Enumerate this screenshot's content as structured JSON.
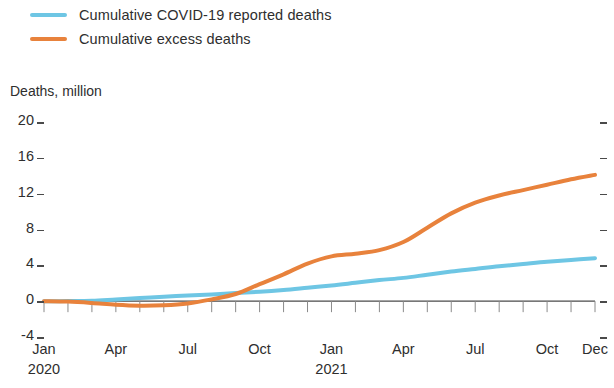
{
  "legend": {
    "items": [
      {
        "label": "Cumulative COVID-19 reported deaths",
        "color": "#6ec6e4",
        "key": "reported"
      },
      {
        "label": "Cumulative excess deaths",
        "color": "#e8823c",
        "key": "excess"
      }
    ]
  },
  "axis_title": "Deaths, million",
  "chart_data": {
    "type": "line",
    "title": "",
    "subtitle": "",
    "xlabel": "",
    "ylabel": "Deaths, million",
    "ylim": [
      -4,
      20
    ],
    "yticks": [
      20,
      16,
      12,
      8,
      4,
      0,
      -4
    ],
    "ytick_labels": [
      "20",
      "16",
      "12",
      "8",
      "4",
      "0",
      "-4"
    ],
    "grid": false,
    "legend_position": "top-left",
    "x_major_labels": [
      "Jan",
      "Apr",
      "Jul",
      "Oct",
      "Jan",
      "Apr",
      "Jul",
      "Oct",
      "Dec"
    ],
    "x_major_sublabels": [
      "2020",
      "",
      "",
      "",
      "2021",
      "",
      "",
      "",
      ""
    ],
    "x_major_indices": [
      0,
      3,
      6,
      9,
      12,
      15,
      18,
      21,
      23
    ],
    "x_minor_ticks": 24,
    "x": [
      "2020-01",
      "2020-02",
      "2020-03",
      "2020-04",
      "2020-05",
      "2020-06",
      "2020-07",
      "2020-08",
      "2020-09",
      "2020-10",
      "2020-11",
      "2020-12",
      "2021-01",
      "2021-02",
      "2021-03",
      "2021-04",
      "2021-05",
      "2021-06",
      "2021-07",
      "2021-08",
      "2021-09",
      "2021-10",
      "2021-11",
      "2021-12"
    ],
    "series": [
      {
        "name": "Cumulative COVID-19 reported deaths",
        "key": "reported",
        "color": "#6ec6e4",
        "values": [
          0,
          0.01,
          0.05,
          0.2,
          0.35,
          0.5,
          0.62,
          0.75,
          0.9,
          1.05,
          1.25,
          1.5,
          1.75,
          2.05,
          2.35,
          2.6,
          2.95,
          3.3,
          3.6,
          3.9,
          4.15,
          4.4,
          4.6,
          4.8
        ]
      },
      {
        "name": "Cumulative excess deaths",
        "key": "excess",
        "color": "#e8823c",
        "values": [
          0,
          -0.05,
          -0.2,
          -0.4,
          -0.5,
          -0.45,
          -0.25,
          0.2,
          0.8,
          1.9,
          3.0,
          4.2,
          5.0,
          5.3,
          5.7,
          6.6,
          8.2,
          9.8,
          11.0,
          11.8,
          12.4,
          13.0,
          13.6,
          14.1
        ]
      }
    ]
  },
  "colors": {
    "reported": "#6ec6e4",
    "excess": "#e8823c",
    "axis": "#4a4a4a",
    "text": "#2e2e2e",
    "background": "#ffffff"
  }
}
